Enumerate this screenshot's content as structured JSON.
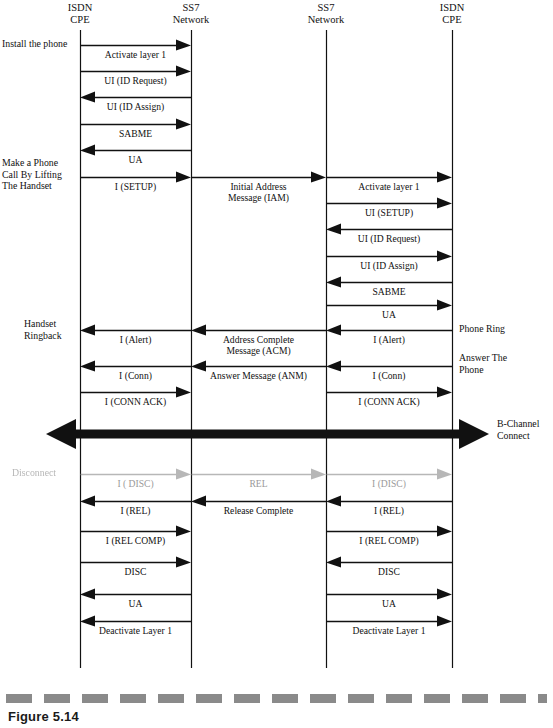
{
  "figure": {
    "caption": "Figure 5.14"
  },
  "lifelines": [
    {
      "id": "ll-1",
      "name": "ISDN CPE (calling)",
      "label": "ISDN\nCPE",
      "x": 80,
      "top": 30,
      "bottom": 668
    },
    {
      "id": "ll-2",
      "name": "SS7 Network (originating)",
      "label": "SS7\nNetwork",
      "x": 191,
      "top": 30,
      "bottom": 668
    },
    {
      "id": "ll-3",
      "name": "SS7 Network (terminating)",
      "label": "SS7\nNetwork",
      "x": 326,
      "top": 30,
      "bottom": 668
    },
    {
      "id": "ll-4",
      "name": "ISDN CPE (called)",
      "label": "ISDN\nCPE",
      "x": 452,
      "top": 30,
      "bottom": 668
    }
  ],
  "side_labels": [
    {
      "id": "sl-install",
      "text": "Install the phone",
      "x": 2,
      "y": 38,
      "align": "left",
      "faded": false
    },
    {
      "id": "sl-makecall",
      "text": "Make a Phone\nCall By Lifting\nThe Handset",
      "x": 2,
      "y": 157,
      "align": "left",
      "faded": false
    },
    {
      "id": "sl-ringback",
      "text": "Handset\nRingback",
      "x": 24,
      "y": 318,
      "align": "left",
      "faded": false
    },
    {
      "id": "sl-disconnect",
      "text": "Disconnect",
      "x": 12,
      "y": 467,
      "align": "left",
      "faded": true
    },
    {
      "id": "sl-phonering",
      "text": "Phone Ring",
      "x": 459,
      "y": 323,
      "align": "left",
      "faded": false
    },
    {
      "id": "sl-answer",
      "text": "Answer The\nPhone",
      "x": 459,
      "y": 352,
      "align": "left",
      "faded": false
    },
    {
      "id": "sl-bchannel",
      "text": "B-Channel\nConnect",
      "x": 497,
      "y": 418,
      "align": "left",
      "faded": false
    }
  ],
  "messages": [
    {
      "id": "m1",
      "label": "Activate layer 1",
      "from": 80,
      "to": 191,
      "y": 45,
      "dir": "right",
      "section": "left",
      "faded": false
    },
    {
      "id": "m2",
      "label": "UI (ID Request)",
      "from": 80,
      "to": 191,
      "y": 71,
      "dir": "right",
      "section": "left",
      "faded": false
    },
    {
      "id": "m3",
      "label": "UI (ID Assign)",
      "from": 191,
      "to": 80,
      "y": 97,
      "dir": "left",
      "section": "left",
      "faded": false
    },
    {
      "id": "m4",
      "label": "SABME",
      "from": 80,
      "to": 191,
      "y": 124,
      "dir": "right",
      "section": "left",
      "faded": false
    },
    {
      "id": "m5",
      "label": "UA",
      "from": 191,
      "to": 80,
      "y": 150,
      "dir": "left",
      "section": "left",
      "faded": false
    },
    {
      "id": "m6",
      "label": "I (SETUP)",
      "from": 80,
      "to": 191,
      "y": 177,
      "dir": "right",
      "section": "left",
      "faded": false
    },
    {
      "id": "m7",
      "label": "Initial Address\nMessage (IAM)",
      "from": 191,
      "to": 326,
      "y": 177,
      "dir": "right",
      "section": "mid",
      "faded": false
    },
    {
      "id": "m8",
      "label": "Activate layer 1",
      "from": 326,
      "to": 452,
      "y": 177,
      "dir": "right",
      "section": "right",
      "faded": false
    },
    {
      "id": "m9",
      "label": "UI (SETUP)",
      "from": 326,
      "to": 452,
      "y": 203,
      "dir": "right",
      "section": "right",
      "faded": false
    },
    {
      "id": "m10",
      "label": "UI (ID Request)",
      "from": 452,
      "to": 326,
      "y": 229,
      "dir": "left",
      "section": "right",
      "faded": false
    },
    {
      "id": "m11",
      "label": "UI (ID Assign)",
      "from": 326,
      "to": 452,
      "y": 256,
      "dir": "right",
      "section": "right",
      "faded": false
    },
    {
      "id": "m12",
      "label": "SABME",
      "from": 452,
      "to": 326,
      "y": 282,
      "dir": "left",
      "section": "right",
      "faded": false
    },
    {
      "id": "m13",
      "label": "UA",
      "from": 326,
      "to": 452,
      "y": 305,
      "dir": "right",
      "section": "right",
      "faded": false
    },
    {
      "id": "m14",
      "label": "I (Alert)",
      "from": 452,
      "to": 326,
      "y": 330,
      "dir": "left",
      "section": "right",
      "faded": false
    },
    {
      "id": "m15",
      "label": "Address Complete\nMessage (ACM)",
      "from": 326,
      "to": 191,
      "y": 330,
      "dir": "left",
      "section": "mid",
      "faded": false
    },
    {
      "id": "m16",
      "label": "I (Alert)",
      "from": 191,
      "to": 80,
      "y": 330,
      "dir": "left",
      "section": "left",
      "faded": false
    },
    {
      "id": "m17",
      "label": "I (Conn)",
      "from": 452,
      "to": 326,
      "y": 366,
      "dir": "left",
      "section": "right",
      "faded": false
    },
    {
      "id": "m18",
      "label": "Answer Message (ANM)",
      "from": 326,
      "to": 191,
      "y": 366,
      "dir": "left",
      "section": "mid",
      "faded": false
    },
    {
      "id": "m19",
      "label": "I (Conn)",
      "from": 191,
      "to": 80,
      "y": 366,
      "dir": "left",
      "section": "left",
      "faded": false
    },
    {
      "id": "m20",
      "label": "I (CONN ACK)",
      "from": 80,
      "to": 191,
      "y": 392,
      "dir": "right",
      "section": "left",
      "faded": false
    },
    {
      "id": "m21",
      "label": "I (CONN ACK)",
      "from": 326,
      "to": 452,
      "y": 392,
      "dir": "right",
      "section": "right",
      "faded": false
    },
    {
      "id": "m22",
      "label": "I ( DISC)",
      "from": 80,
      "to": 191,
      "y": 474,
      "dir": "right",
      "section": "left",
      "faded": true
    },
    {
      "id": "m23",
      "label": "REL",
      "from": 191,
      "to": 326,
      "y": 474,
      "dir": "right",
      "section": "mid",
      "faded": true
    },
    {
      "id": "m24",
      "label": "I (DISC)",
      "from": 326,
      "to": 452,
      "y": 474,
      "dir": "right",
      "section": "right",
      "faded": true
    },
    {
      "id": "m25",
      "label": "I (REL)",
      "from": 191,
      "to": 80,
      "y": 501,
      "dir": "left",
      "section": "left",
      "faded": false
    },
    {
      "id": "m26",
      "label": "Release Complete",
      "from": 326,
      "to": 191,
      "y": 501,
      "dir": "left",
      "section": "mid",
      "faded": false
    },
    {
      "id": "m27",
      "label": "I (REL)",
      "from": 452,
      "to": 326,
      "y": 501,
      "dir": "left",
      "section": "right",
      "faded": false
    },
    {
      "id": "m28",
      "label": "I (REL COMP)",
      "from": 80,
      "to": 191,
      "y": 531,
      "dir": "right",
      "section": "left",
      "faded": false
    },
    {
      "id": "m29",
      "label": "I (REL COMP)",
      "from": 326,
      "to": 452,
      "y": 531,
      "dir": "right",
      "section": "right",
      "faded": false
    },
    {
      "id": "m30",
      "label": "DISC",
      "from": 80,
      "to": 191,
      "y": 562,
      "dir": "right",
      "section": "left",
      "faded": false
    },
    {
      "id": "m31",
      "label": "DISC",
      "from": 452,
      "to": 326,
      "y": 562,
      "dir": "left",
      "section": "right",
      "faded": false
    },
    {
      "id": "m32",
      "label": "UA",
      "from": 191,
      "to": 80,
      "y": 594,
      "dir": "left",
      "section": "left",
      "faded": false
    },
    {
      "id": "m33",
      "label": "UA",
      "from": 326,
      "to": 452,
      "y": 594,
      "dir": "right",
      "section": "right",
      "faded": false
    },
    {
      "id": "m34",
      "label": "Deactivate Layer 1",
      "from": 191,
      "to": 80,
      "y": 621,
      "dir": "left",
      "section": "left",
      "faded": false
    },
    {
      "id": "m35",
      "label": "Deactivate Layer 1",
      "from": 326,
      "to": 452,
      "y": 621,
      "dir": "right",
      "section": "right",
      "faded": false
    }
  ],
  "bchannel": {
    "name": "b-channel-connect-arrow",
    "label": "B-Channel\nConnect",
    "x1": 46,
    "x2": 489,
    "y": 434,
    "thickness": 9,
    "heads": "both"
  },
  "dash_bar": {
    "y": 694,
    "color": "#8a8a8a",
    "dash_width": 26,
    "gap_width": 12
  },
  "colors": {
    "ink": "#111111",
    "faded_ink": "#9a9a9a",
    "dash": "#8a8a8a",
    "paper": "#ffffff"
  }
}
